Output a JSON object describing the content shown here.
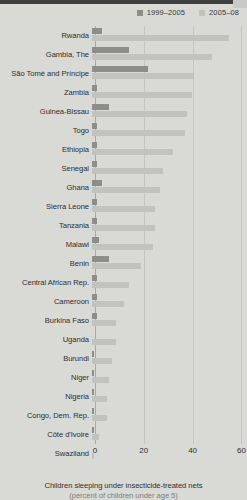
{
  "legend": {
    "items": [
      {
        "label": "1999–2005",
        "color": "#8d8d8a",
        "key": "period1"
      },
      {
        "label": "2005–08",
        "color": "#c2c2bf",
        "key": "period2"
      }
    ]
  },
  "caption": {
    "line1": "Children sleeping under insecticide-treated nets",
    "line2": "(percent of children under age 5)"
  },
  "axis": {
    "ticks": [
      "0",
      "20",
      "40",
      "60"
    ],
    "min": 0,
    "max": 60
  },
  "chart_data": {
    "type": "bar",
    "orientation": "horizontal",
    "title": "Children sleeping under insecticide-treated nets",
    "subtitle": "(percent of children under age 5)",
    "xlabel": "",
    "ylabel": "",
    "xlim": [
      0,
      60
    ],
    "xticks": [
      0,
      20,
      40,
      60
    ],
    "grid": true,
    "legend_position": "top-right",
    "categories": [
      "Rwanda",
      "Gambia, The",
      "São Tomé and Príncipe",
      "Zambia",
      "Guinea-Bissau",
      "Togo",
      "Ethiopia",
      "Senegal",
      "Ghana",
      "Sierra Leone",
      "Tanzania",
      "Malawi",
      "Benin",
      "Central African Rep.",
      "Cameroon",
      "Burkina Faso",
      "Uganda",
      "Burundi",
      "Niger",
      "Nigeria",
      "Congo, Dem. Rep.",
      "Côte d'Ivoire",
      "Swaziland"
    ],
    "series": [
      {
        "name": "1999–2005",
        "color": "#8d8d8a",
        "values": [
          4,
          15,
          23,
          2,
          7,
          2,
          2,
          2,
          4,
          2,
          2,
          3,
          7,
          2,
          2,
          2,
          0,
          1,
          1,
          1,
          1,
          1,
          0
        ]
      },
      {
        "name": "2005–08",
        "color": "#c2c2bf",
        "values": [
          56,
          49,
          42,
          41,
          39,
          38,
          33,
          29,
          28,
          26,
          26,
          25,
          20,
          15,
          13,
          10,
          10,
          8,
          7,
          6,
          6,
          3,
          1
        ]
      }
    ]
  }
}
